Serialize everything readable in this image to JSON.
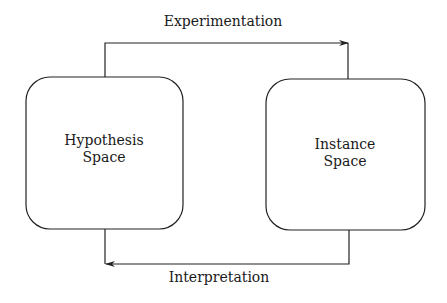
{
  "diagram": {
    "nodes": [
      {
        "id": "hypothesis",
        "line1": "Hypothesis",
        "line2": "Space"
      },
      {
        "id": "instance",
        "line1": "Instance",
        "line2": "Space"
      }
    ],
    "edges": [
      {
        "from": "hypothesis",
        "to": "instance",
        "label": "Experimentation"
      },
      {
        "from": "instance",
        "to": "hypothesis",
        "label": "Interpretation"
      }
    ],
    "colors": {
      "stroke": "#222222",
      "text": "#1a1a1a",
      "background": "#ffffff"
    }
  }
}
